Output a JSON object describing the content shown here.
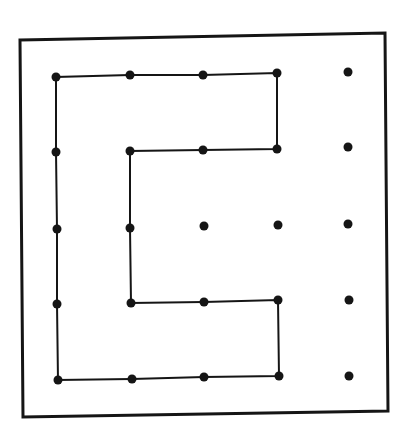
{
  "diagram": {
    "type": "dot-grid-path",
    "grid": {
      "rows": 5,
      "cols": 5
    },
    "colors": {
      "ink": "#151515",
      "background": "#ffffff"
    },
    "frame": [
      [
        20,
        40
      ],
      [
        385,
        33
      ],
      [
        388,
        411
      ],
      [
        23,
        417
      ]
    ],
    "dots": [
      [
        [
          56,
          77
        ],
        [
          130,
          75
        ],
        [
          203,
          75
        ],
        [
          277,
          73
        ],
        [
          348,
          72
        ]
      ],
      [
        [
          56,
          152
        ],
        [
          130,
          151
        ],
        [
          203,
          150
        ],
        [
          277,
          149
        ],
        [
          348,
          147
        ]
      ],
      [
        [
          57,
          229
        ],
        [
          130,
          228
        ],
        [
          204,
          226
        ],
        [
          278,
          225
        ],
        [
          348,
          224
        ]
      ],
      [
        [
          57,
          304
        ],
        [
          131,
          303
        ],
        [
          204,
          302
        ],
        [
          278,
          300
        ],
        [
          349,
          300
        ]
      ],
      [
        [
          58,
          380
        ],
        [
          132,
          379
        ],
        [
          204,
          377
        ],
        [
          279,
          376
        ],
        [
          349,
          376
        ]
      ]
    ],
    "path": [
      [
        1,
        2
      ],
      [
        1,
        3
      ],
      [
        0,
        3
      ],
      [
        0,
        2
      ],
      [
        0,
        1
      ],
      [
        0,
        0
      ],
      [
        1,
        0
      ],
      [
        2,
        0
      ],
      [
        3,
        0
      ],
      [
        4,
        0
      ],
      [
        4,
        1
      ],
      [
        4,
        2
      ],
      [
        4,
        3
      ],
      [
        3,
        3
      ],
      [
        3,
        2
      ],
      [
        3,
        1
      ],
      [
        2,
        1
      ],
      [
        1,
        1
      ],
      [
        1,
        2
      ]
    ]
  }
}
